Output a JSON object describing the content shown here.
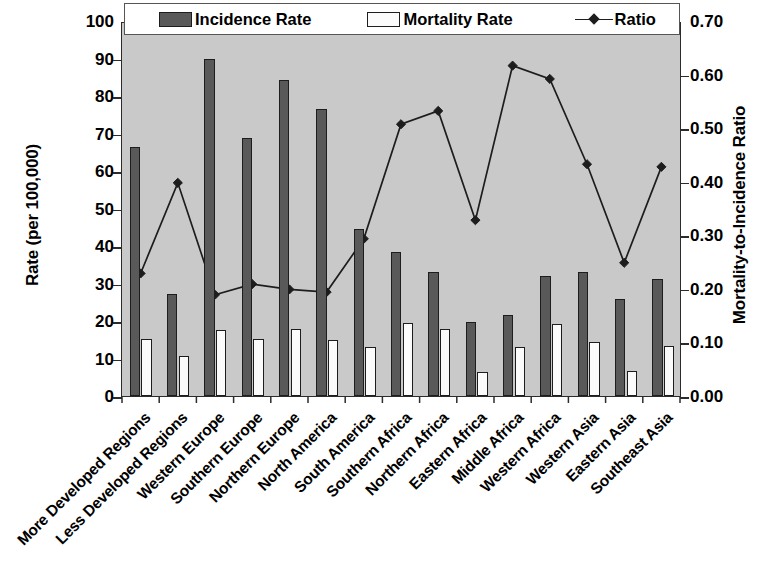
{
  "chart_data": {
    "type": "bar",
    "title": "",
    "subtitle": "",
    "xlabel": "",
    "ylabel": "Rate (per 100,000)",
    "y2label": "Mortality-to-Incidence Ratio",
    "ylim": [
      0,
      100
    ],
    "y2lim": [
      0.0,
      0.7
    ],
    "grid": false,
    "legend_position": "top-inside",
    "plot_background": "#c9c9c9",
    "categories": [
      "More Developed Regions",
      "Less Developed Regions",
      "Western Europe",
      "Southern Europe",
      "Northern Europe",
      "North America",
      "South America",
      "Southern Africa",
      "Northern Africa",
      "Eastern Africa",
      "Middle Africa",
      "Western Africa",
      "Western Asia",
      "Eastern Asia",
      "Southeast Asia"
    ],
    "series": [
      {
        "name": "Incidence Rate",
        "axis": "left",
        "kind": "bar",
        "color": "#595959",
        "values": [
          66.4,
          27.3,
          90.0,
          68.8,
          84.2,
          76.6,
          44.5,
          38.4,
          33.0,
          19.8,
          21.7,
          32.0,
          33.0,
          25.8,
          31.2
        ]
      },
      {
        "name": "Mortality Rate",
        "axis": "left",
        "kind": "bar",
        "color": "#fbfbfb",
        "values": [
          15.3,
          10.8,
          17.5,
          15.2,
          17.8,
          14.9,
          13.2,
          19.5,
          17.9,
          6.5,
          13.2,
          19.1,
          14.5,
          6.6,
          13.3
        ]
      },
      {
        "name": "Ratio",
        "axis": "right",
        "kind": "line",
        "color": "#1d1d1d",
        "marker": "diamond",
        "values": [
          0.23,
          0.4,
          0.19,
          0.21,
          0.2,
          0.195,
          0.295,
          0.51,
          0.535,
          0.33,
          0.62,
          0.595,
          0.435,
          0.25,
          0.43
        ]
      }
    ],
    "y_ticks": [
      0,
      10,
      20,
      30,
      40,
      50,
      60,
      70,
      80,
      90,
      100
    ],
    "y_tick_labels": [
      "0",
      "10",
      "20",
      "30",
      "40",
      "50",
      "60",
      "70",
      "80",
      "90",
      "100"
    ],
    "y2_ticks": [
      0.0,
      0.1,
      0.2,
      0.3,
      0.4,
      0.5,
      0.6,
      0.7
    ],
    "y2_tick_labels": [
      "0.00",
      "0.10",
      "0.20",
      "0.30",
      "0.40",
      "0.50",
      "0.60",
      "0.70"
    ]
  },
  "legend": {
    "items": [
      {
        "label": "Incidence Rate",
        "swatch": "dark-bar-swatch"
      },
      {
        "label": "Mortality Rate",
        "swatch": "light-bar-swatch"
      },
      {
        "label": "Ratio",
        "swatch": "line-marker-swatch"
      }
    ]
  },
  "axes": {
    "left_title": "Rate (per 100,000)",
    "right_title": "Mortality-to-Incidence Ratio"
  }
}
